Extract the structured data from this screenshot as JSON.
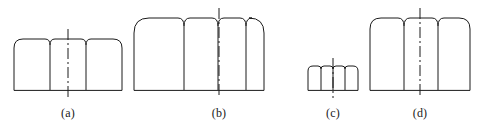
{
  "figure": {
    "background_color": "#ffffff",
    "line_color": "#1a1a1a",
    "centerline_color": "#1a1a1a",
    "stroke_width": 1,
    "shapes": [
      {
        "id": "a",
        "label": "(a)",
        "sections": 3,
        "x": 14,
        "y": 39,
        "width": 108,
        "height": 51,
        "corner_radius": 9,
        "notch_half_width": 5,
        "notch_depth": 6,
        "divider_x_offsets": [
          36,
          72
        ],
        "centerline_x": 68,
        "centerline_top": 29,
        "centerline_bottom": 98,
        "caption_x": 68,
        "caption_y": 106
      },
      {
        "id": "b",
        "label": "(b)",
        "sections": 4,
        "x": 134,
        "y": 18,
        "width": 130,
        "height": 72,
        "corner_radius": 15,
        "notch_half_width": 6,
        "notch_depth": 8,
        "divider_x_offsets": [
          50,
          84,
          112
        ],
        "centerline_x": 219,
        "centerline_top": 8,
        "centerline_bottom": 98,
        "caption_x": 219,
        "caption_y": 106
      },
      {
        "id": "c",
        "label": "(c)",
        "sections": 4,
        "x": 308,
        "y": 66,
        "width": 50,
        "height": 24,
        "corner_radius": 5,
        "notch_half_width": 3,
        "notch_depth": 3,
        "divider_x_offsets": [
          13,
          25,
          37
        ],
        "centerline_x": 333,
        "centerline_top": 58,
        "centerline_bottom": 98,
        "caption_x": 333,
        "caption_y": 106
      },
      {
        "id": "d",
        "label": "(d)",
        "sections": 3,
        "x": 370,
        "y": 18,
        "width": 100,
        "height": 72,
        "corner_radius": 11,
        "notch_half_width": 6,
        "notch_depth": 8,
        "divider_x_offsets": [
          34,
          68
        ],
        "centerline_x": 420,
        "centerline_top": 8,
        "centerline_bottom": 98,
        "caption_x": 420,
        "caption_y": 106
      }
    ]
  }
}
